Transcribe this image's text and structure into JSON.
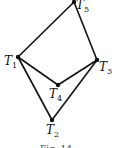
{
  "diagram": {
    "type": "graph",
    "nodes": [
      {
        "id": "T1",
        "letter": "T",
        "sub": "1",
        "x": 18,
        "y": 57
      },
      {
        "id": "T2",
        "letter": "T",
        "sub": "2",
        "x": 52,
        "y": 120
      },
      {
        "id": "T3",
        "letter": "T",
        "sub": "3",
        "x": 97,
        "y": 60
      },
      {
        "id": "T4",
        "letter": "T",
        "sub": "4",
        "x": 58,
        "y": 85
      },
      {
        "id": "T5",
        "letter": "T",
        "sub": "5",
        "x": 74,
        "y": 2
      }
    ],
    "edges": [
      [
        "T1",
        "T5"
      ],
      [
        "T5",
        "T3"
      ],
      [
        "T1",
        "T4"
      ],
      [
        "T4",
        "T3"
      ],
      [
        "T1",
        "T2"
      ],
      [
        "T2",
        "T3"
      ]
    ],
    "caption": "Fig. 14"
  }
}
